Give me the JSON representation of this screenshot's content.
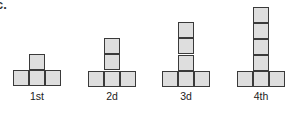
{
  "part_label": "c.",
  "figures": [
    {
      "label": "1st",
      "stack_height": 1,
      "base_cells": 3
    },
    {
      "label": "2d",
      "stack_height": 2,
      "base_cells": 3
    },
    {
      "label": "3d",
      "stack_height": 3,
      "base_cells": 3
    },
    {
      "label": "4th",
      "stack_height": 4,
      "base_cells": 3
    }
  ],
  "colors": {
    "cell_fill": "#dedede",
    "cell_stroke": "#3a3a3a",
    "background": "#ffffff"
  }
}
